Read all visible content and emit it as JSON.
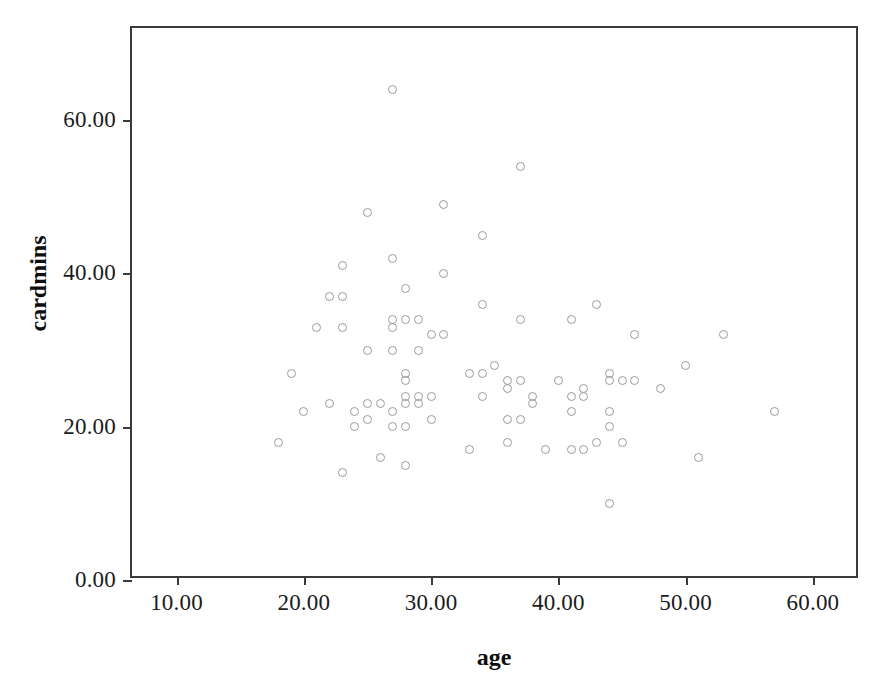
{
  "chart_data": {
    "type": "scatter",
    "title": "",
    "xlabel": "age",
    "ylabel": "cardmins",
    "xlim": [
      6.5,
      63.7
    ],
    "ylim": [
      0,
      72
    ],
    "grid": false,
    "legend": null,
    "marker": {
      "shape": "open-circle",
      "edge_color": "#9a9aa2",
      "fill": "none",
      "size_px": 9
    },
    "axis_color": "#3b3b3b",
    "text_color": "#1b1b1b",
    "xticks": [
      10,
      20,
      30,
      40,
      50,
      60
    ],
    "xticklabels": [
      "10.00",
      "20.00",
      "30.00",
      "40.00",
      "50.00",
      "60.00"
    ],
    "yticks": [
      0,
      20,
      40,
      60
    ],
    "yticklabels": [
      "0.00",
      "20.00",
      "40.00",
      "60.00"
    ],
    "points": [
      {
        "x": 18,
        "y": 18
      },
      {
        "x": 19,
        "y": 27
      },
      {
        "x": 20,
        "y": 22
      },
      {
        "x": 21,
        "y": 33
      },
      {
        "x": 22,
        "y": 23
      },
      {
        "x": 22,
        "y": 37
      },
      {
        "x": 23,
        "y": 14
      },
      {
        "x": 23,
        "y": 33
      },
      {
        "x": 23,
        "y": 37
      },
      {
        "x": 23,
        "y": 41
      },
      {
        "x": 24,
        "y": 20
      },
      {
        "x": 24,
        "y": 22
      },
      {
        "x": 25,
        "y": 21
      },
      {
        "x": 25,
        "y": 23
      },
      {
        "x": 25,
        "y": 30
      },
      {
        "x": 25,
        "y": 48
      },
      {
        "x": 26,
        "y": 16
      },
      {
        "x": 26,
        "y": 23
      },
      {
        "x": 27,
        "y": 20
      },
      {
        "x": 27,
        "y": 22
      },
      {
        "x": 27,
        "y": 30
      },
      {
        "x": 27,
        "y": 33
      },
      {
        "x": 27,
        "y": 34
      },
      {
        "x": 27,
        "y": 42
      },
      {
        "x": 27,
        "y": 64
      },
      {
        "x": 28,
        "y": 15
      },
      {
        "x": 28,
        "y": 20
      },
      {
        "x": 28,
        "y": 23
      },
      {
        "x": 28,
        "y": 24
      },
      {
        "x": 28,
        "y": 26
      },
      {
        "x": 28,
        "y": 27
      },
      {
        "x": 28,
        "y": 34
      },
      {
        "x": 28,
        "y": 38
      },
      {
        "x": 29,
        "y": 23
      },
      {
        "x": 29,
        "y": 24
      },
      {
        "x": 29,
        "y": 30
      },
      {
        "x": 29,
        "y": 34
      },
      {
        "x": 30,
        "y": 21
      },
      {
        "x": 30,
        "y": 24
      },
      {
        "x": 30,
        "y": 32
      },
      {
        "x": 31,
        "y": 32
      },
      {
        "x": 31,
        "y": 40
      },
      {
        "x": 31,
        "y": 49
      },
      {
        "x": 33,
        "y": 17
      },
      {
        "x": 33,
        "y": 27
      },
      {
        "x": 34,
        "y": 24
      },
      {
        "x": 34,
        "y": 27
      },
      {
        "x": 34,
        "y": 36
      },
      {
        "x": 34,
        "y": 45
      },
      {
        "x": 35,
        "y": 28
      },
      {
        "x": 36,
        "y": 18
      },
      {
        "x": 36,
        "y": 21
      },
      {
        "x": 36,
        "y": 25
      },
      {
        "x": 36,
        "y": 26
      },
      {
        "x": 37,
        "y": 21
      },
      {
        "x": 37,
        "y": 26
      },
      {
        "x": 37,
        "y": 34
      },
      {
        "x": 37,
        "y": 54
      },
      {
        "x": 38,
        "y": 23
      },
      {
        "x": 38,
        "y": 24
      },
      {
        "x": 39,
        "y": 17
      },
      {
        "x": 40,
        "y": 26
      },
      {
        "x": 41,
        "y": 17
      },
      {
        "x": 41,
        "y": 22
      },
      {
        "x": 41,
        "y": 24
      },
      {
        "x": 41,
        "y": 34
      },
      {
        "x": 42,
        "y": 17
      },
      {
        "x": 42,
        "y": 24
      },
      {
        "x": 42,
        "y": 25
      },
      {
        "x": 43,
        "y": 18
      },
      {
        "x": 43,
        "y": 36
      },
      {
        "x": 44,
        "y": 10
      },
      {
        "x": 44,
        "y": 20
      },
      {
        "x": 44,
        "y": 22
      },
      {
        "x": 44,
        "y": 26
      },
      {
        "x": 44,
        "y": 27
      },
      {
        "x": 45,
        "y": 18
      },
      {
        "x": 45,
        "y": 26
      },
      {
        "x": 46,
        "y": 26
      },
      {
        "x": 46,
        "y": 32
      },
      {
        "x": 48,
        "y": 25
      },
      {
        "x": 50,
        "y": 28
      },
      {
        "x": 51,
        "y": 16
      },
      {
        "x": 53,
        "y": 32
      },
      {
        "x": 57,
        "y": 22
      }
    ]
  }
}
